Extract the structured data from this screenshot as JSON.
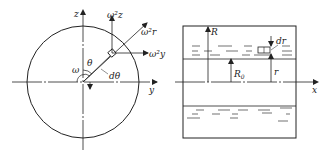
{
  "left_figure": {
    "axes": {
      "vertical": "z",
      "horizontal": "y"
    },
    "angle_label": "θ",
    "dtheta_label": "dθ",
    "omega_label": "ω",
    "force_labels": {
      "radial": "ω²r",
      "vertical": "ω²z",
      "horizontal": "ω²y"
    }
  },
  "right_figure": {
    "axis_label": "x",
    "R_label": "R",
    "R0_label": "R",
    "R0_sub": "0",
    "r_label": "r",
    "dr_label": "dr"
  },
  "colors": {
    "stroke": "#222222",
    "background": "#ffffff"
  }
}
